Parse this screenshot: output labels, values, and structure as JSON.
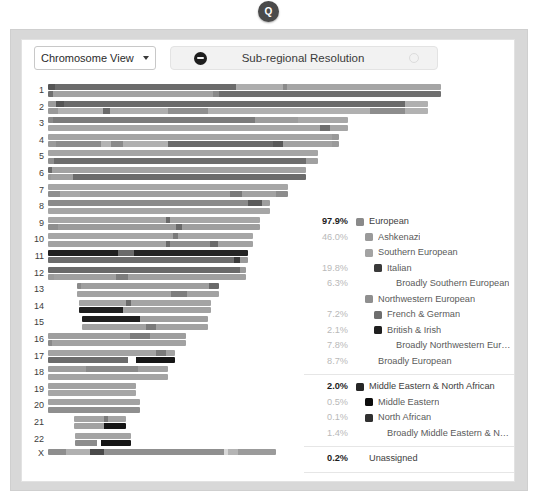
{
  "badge": {
    "label": "Q",
    "name": "quick-view-badge"
  },
  "toolbar": {
    "view_select": {
      "value": "Chromosome View",
      "icon": "chevron-down-icon"
    },
    "resolution_toggle": {
      "label": "Sub-regional Resolution",
      "left_icon": "minus-circle-icon",
      "right_icon": "circle-outline-icon"
    }
  },
  "chart_data": {
    "type": "chromosome-painting",
    "xlabel": "",
    "ylabel": "Chromosome",
    "legend_position": "right",
    "grid": false,
    "colors": {
      "european": "#8a8a8a",
      "ashkenazi": "#9a9a9a",
      "southern_european": "#a3a3a3",
      "italian": "#3a3a3a",
      "broadly_southern_european": "#b5b5b5",
      "northwestern_european": "#8f8f8f",
      "french_german": "#6e6e6e",
      "british_irish": "#1f1f1f",
      "broadly_northwestern_european": "#a8a8a8",
      "broadly_european": "#bdbdbd",
      "middle_eastern_north_african": "#262626",
      "middle_eastern": "#0d0d0d",
      "north_african": "#303030",
      "broadly_mena": "#555555",
      "unassigned": "#cfcfcf"
    },
    "chromosomes": [
      {
        "label": "1",
        "offset": 0,
        "length": 393,
        "strand_a": [
          [
            0,
            7,
            "#555555"
          ],
          [
            7,
            181,
            "#6b6b6b"
          ],
          [
            188,
            47,
            "#adadad"
          ],
          [
            235,
            4,
            "#8a8a8a"
          ],
          [
            239,
            154,
            "#a5a5a5"
          ]
        ],
        "strand_b": [
          [
            0,
            5,
            "#707070"
          ],
          [
            5,
            160,
            "#a2a2a2"
          ],
          [
            165,
            6,
            "#8a8a8a"
          ],
          [
            171,
            222,
            "#6f6f6f"
          ]
        ]
      },
      {
        "label": "2",
        "offset": 0,
        "length": 380,
        "strand_a": [
          [
            0,
            8,
            "#9c9c9c"
          ],
          [
            8,
            8,
            "#555555"
          ],
          [
            16,
            341,
            "#6a6a6a"
          ],
          [
            357,
            23,
            "#b0b0b0"
          ]
        ],
        "strand_b": [
          [
            0,
            10,
            "#9a9a9a"
          ],
          [
            10,
            45,
            "#b2b2b2"
          ],
          [
            55,
            7,
            "#6a6a6a"
          ],
          [
            62,
            58,
            "#aeaeae"
          ],
          [
            120,
            40,
            "#8f8f8f"
          ],
          [
            160,
            162,
            "#b0b0b0"
          ],
          [
            322,
            35,
            "#8d8d8d"
          ],
          [
            357,
            23,
            "#b2b2b2"
          ]
        ]
      },
      {
        "label": "3",
        "offset": 0,
        "length": 300,
        "strand_a": [
          [
            0,
            5,
            "#8a8a8a"
          ],
          [
            5,
            202,
            "#7b7b7b"
          ],
          [
            207,
            43,
            "#9d9d9d"
          ],
          [
            250,
            50,
            "#a8a8a8"
          ]
        ],
        "strand_b": [
          [
            0,
            272,
            "#a6a6a6"
          ],
          [
            272,
            10,
            "#6f6f6f"
          ],
          [
            282,
            18,
            "#a6a6a6"
          ]
        ]
      },
      {
        "label": "4",
        "offset": 0,
        "length": 291,
        "strand_a": [
          [
            0,
            284,
            "#a4a4a4"
          ],
          [
            284,
            7,
            "#9a9a9a"
          ]
        ],
        "strand_b": [
          [
            0,
            8,
            "#9a9a9a"
          ],
          [
            8,
            45,
            "#8c8c8c"
          ],
          [
            53,
            10,
            "#b4b4b4"
          ],
          [
            63,
            12,
            "#8b8b8b"
          ],
          [
            75,
            45,
            "#b0b0b0"
          ],
          [
            120,
            105,
            "#6a6a6a"
          ],
          [
            225,
            10,
            "#5a5a5a"
          ],
          [
            235,
            49,
            "#a2a2a2"
          ],
          [
            284,
            7,
            "#9a9a9a"
          ]
        ]
      },
      {
        "label": "5",
        "offset": 0,
        "length": 270,
        "strand_a": [
          [
            0,
            270,
            "#a5a5a5"
          ]
        ],
        "strand_b": [
          [
            0,
            6,
            "#8f8f8f"
          ],
          [
            6,
            252,
            "#6d6d6d"
          ],
          [
            258,
            12,
            "#a0a0a0"
          ]
        ]
      },
      {
        "label": "6",
        "offset": 0,
        "length": 258,
        "strand_a": [
          [
            0,
            4,
            "#6a6a6a"
          ],
          [
            4,
            254,
            "#a2a2a2"
          ]
        ],
        "strand_b": [
          [
            0,
            3,
            "#9a9a9a"
          ],
          [
            3,
            22,
            "#a0a0a0"
          ],
          [
            25,
            233,
            "#6b6b6b"
          ]
        ]
      },
      {
        "label": "7",
        "offset": 0,
        "length": 240,
        "strand_a": [
          [
            0,
            240,
            "#a6a6a6"
          ]
        ],
        "strand_b": [
          [
            0,
            12,
            "#8e8e8e"
          ],
          [
            12,
            20,
            "#a8a8a8"
          ],
          [
            32,
            150,
            "#9e9e9e"
          ],
          [
            182,
            12,
            "#7a7a7a"
          ],
          [
            194,
            34,
            "#a2a2a2"
          ],
          [
            228,
            12,
            "#8c8c8c"
          ]
        ]
      },
      {
        "label": "8",
        "offset": 0,
        "length": 222,
        "strand_a": [
          [
            0,
            200,
            "#8b8b8b"
          ],
          [
            200,
            14,
            "#5a5a5a"
          ],
          [
            214,
            8,
            "#9e9e9e"
          ]
        ],
        "strand_b": [
          [
            0,
            222,
            "#a6a6a6"
          ]
        ]
      },
      {
        "label": "9",
        "offset": 0,
        "length": 212,
        "strand_a": [
          [
            0,
            118,
            "#a6a6a6"
          ],
          [
            118,
            4,
            "#6a6a6a"
          ],
          [
            122,
            90,
            "#a6a6a6"
          ]
        ],
        "strand_b": [
          [
            0,
            10,
            "#8e8e8e"
          ],
          [
            10,
            118,
            "#9b9b9b"
          ],
          [
            128,
            6,
            "#6a6a6a"
          ],
          [
            134,
            78,
            "#9e9e9e"
          ]
        ]
      },
      {
        "label": "10",
        "offset": 0,
        "length": 205,
        "strand_a": [
          [
            0,
            125,
            "#a6a6a6"
          ],
          [
            125,
            5,
            "#7a7a7a"
          ],
          [
            130,
            75,
            "#a6a6a6"
          ]
        ],
        "strand_b": [
          [
            0,
            118,
            "#a2a2a2"
          ],
          [
            118,
            4,
            "#6a6a6a"
          ],
          [
            122,
            40,
            "#8f8f8f"
          ],
          [
            162,
            8,
            "#6a6a6a"
          ],
          [
            170,
            35,
            "#a2a2a2"
          ]
        ]
      },
      {
        "label": "11",
        "offset": 0,
        "length": 200,
        "strand_a": [
          [
            0,
            70,
            "#1f1f1f"
          ],
          [
            70,
            16,
            "#6a6a6a"
          ],
          [
            86,
            114,
            "#252525"
          ]
        ],
        "strand_b": [
          [
            0,
            186,
            "#6c6c6c"
          ],
          [
            186,
            6,
            "#3a3a3a"
          ],
          [
            192,
            8,
            "#9a9a9a"
          ]
        ]
      },
      {
        "label": "12",
        "offset": 0,
        "length": 198,
        "strand_a": [
          [
            0,
            192,
            "#6a6a6a"
          ],
          [
            192,
            6,
            "#9a9a9a"
          ]
        ],
        "strand_b": [
          [
            0,
            6,
            "#9a9a9a"
          ],
          [
            6,
            62,
            "#a0a0a0"
          ],
          [
            68,
            12,
            "#7d7d7d"
          ],
          [
            80,
            118,
            "#a0a0a0"
          ]
        ]
      },
      {
        "label": "13",
        "offset": 29,
        "length": 142,
        "strand_a": [
          [
            0,
            4,
            "#8a8a8a"
          ],
          [
            4,
            128,
            "#9e9e9e"
          ],
          [
            132,
            10,
            "#6a6a6a"
          ]
        ],
        "strand_b": [
          [
            0,
            94,
            "#a2a2a2"
          ],
          [
            94,
            16,
            "#7d7d7d"
          ],
          [
            110,
            32,
            "#a2a2a2"
          ]
        ]
      },
      {
        "label": "14",
        "offset": 31,
        "length": 132,
        "strand_a": [
          [
            0,
            47,
            "#a4a4a4"
          ],
          [
            47,
            5,
            "#6a6a6a"
          ],
          [
            52,
            80,
            "#a4a4a4"
          ]
        ],
        "strand_b": [
          [
            0,
            44,
            "#1f1f1f"
          ],
          [
            44,
            88,
            "#a2a2a2"
          ]
        ]
      },
      {
        "label": "15",
        "offset": 34,
        "length": 126,
        "strand_a": [
          [
            0,
            58,
            "#1f1f1f"
          ],
          [
            58,
            68,
            "#9f9f9f"
          ]
        ],
        "strand_b": [
          [
            0,
            64,
            "#a2a2a2"
          ],
          [
            64,
            10,
            "#7a7a7a"
          ],
          [
            74,
            52,
            "#a2a2a2"
          ]
        ]
      },
      {
        "label": "16",
        "offset": 0,
        "length": 138,
        "strand_a": [
          [
            0,
            82,
            "#9e9e9e"
          ],
          [
            82,
            20,
            "#7c7c7c"
          ],
          [
            102,
            36,
            "#9e9e9e"
          ]
        ],
        "strand_b": [
          [
            0,
            4,
            "#8a8a8a"
          ],
          [
            4,
            134,
            "#a2a2a2"
          ]
        ]
      },
      {
        "label": "17",
        "offset": 0,
        "length": 127,
        "strand_a": [
          [
            0,
            108,
            "#a3a3a3"
          ],
          [
            108,
            10,
            "#7a7a7a"
          ],
          [
            118,
            9,
            "#a3a3a3"
          ]
        ],
        "strand_b": [
          [
            0,
            80,
            "#6c6c6c"
          ],
          [
            80,
            8,
            "#ffffff"
          ],
          [
            88,
            39,
            "#161616"
          ]
        ]
      },
      {
        "label": "18",
        "offset": 0,
        "length": 120,
        "strand_a": [
          [
            0,
            38,
            "#9e9e9e"
          ],
          [
            38,
            52,
            "#8a8a8a"
          ],
          [
            90,
            30,
            "#a2a2a2"
          ]
        ],
        "strand_b": [
          [
            0,
            120,
            "#a4a4a4"
          ]
        ]
      },
      {
        "label": "19",
        "offset": 0,
        "length": 88,
        "strand_a": [
          [
            0,
            88,
            "#a2a2a2"
          ]
        ],
        "strand_b": [
          [
            0,
            88,
            "#a6a6a6"
          ]
        ]
      },
      {
        "label": "20",
        "offset": 0,
        "length": 92,
        "strand_a": [
          [
            0,
            92,
            "#a2a2a2"
          ]
        ],
        "strand_b": [
          [
            0,
            92,
            "#8f8f8f"
          ]
        ]
      },
      {
        "label": "21",
        "offset": 26,
        "length": 52,
        "strand_a": [
          [
            0,
            30,
            "#a4a4a4"
          ],
          [
            30,
            4,
            "#7a7a7a"
          ],
          [
            34,
            18,
            "#a4a4a4"
          ]
        ],
        "strand_b": [
          [
            0,
            30,
            "#a2a2a2"
          ],
          [
            30,
            22,
            "#161616"
          ]
        ]
      },
      {
        "label": "22",
        "offset": 27,
        "length": 56,
        "strand_a": [
          [
            0,
            56,
            "#a4a4a4"
          ]
        ],
        "strand_b": [
          [
            0,
            22,
            "#8c8c8c"
          ],
          [
            22,
            4,
            "#ffffff"
          ],
          [
            26,
            30,
            "#161616"
          ]
        ]
      },
      {
        "label": "X",
        "offset": 0,
        "length": 228,
        "single": true,
        "strand_a": [
          [
            0,
            18,
            "#8e8e8e"
          ],
          [
            18,
            24,
            "#b0b0b0"
          ],
          [
            42,
            14,
            "#4a4a4a"
          ],
          [
            56,
            120,
            "#8f8f8f"
          ],
          [
            176,
            4,
            "#d8d8d8"
          ],
          [
            180,
            10,
            "#b4b4b4"
          ],
          [
            190,
            38,
            "#9b9b9b"
          ]
        ]
      }
    ]
  },
  "legend": {
    "groups": [
      {
        "name": "european-group",
        "rows": [
          {
            "pct": "97.9%",
            "label": "European",
            "indent": 0,
            "swatch": "#8a8a8a",
            "strong": true
          },
          {
            "pct": "46.0%",
            "label": "Ashkenazi",
            "indent": 1,
            "swatch": "#9a9a9a",
            "strong": false
          },
          {
            "pct": "",
            "label": "Southern European",
            "indent": 1,
            "swatch": "#a3a3a3",
            "strong": false
          },
          {
            "pct": "19.8%",
            "label": "Italian",
            "indent": 2,
            "swatch": "#3a3a3a",
            "strong": false
          },
          {
            "pct": "6.3%",
            "label": "Broadly Southern European",
            "indent": 3,
            "swatch": null,
            "strong": false
          },
          {
            "pct": "",
            "label": "Northwestern European",
            "indent": 1,
            "swatch": "#8f8f8f",
            "strong": false
          },
          {
            "pct": "7.2%",
            "label": "French & German",
            "indent": 2,
            "swatch": "#6e6e6e",
            "strong": false
          },
          {
            "pct": "2.1%",
            "label": "British & Irish",
            "indent": 2,
            "swatch": "#1f1f1f",
            "strong": false
          },
          {
            "pct": "7.8%",
            "label": "Broadly Northwestern European",
            "indent": 3,
            "swatch": null,
            "strong": false
          },
          {
            "pct": "8.7%",
            "label": "Broadly European",
            "indent": 1,
            "swatch": null,
            "strong": false
          }
        ]
      },
      {
        "name": "mena-group",
        "rows": [
          {
            "pct": "2.0%",
            "label": "Middle Eastern & North African",
            "indent": 0,
            "swatch": "#262626",
            "strong": true
          },
          {
            "pct": "0.5%",
            "label": "Middle Eastern",
            "indent": 1,
            "swatch": "#0d0d0d",
            "strong": false
          },
          {
            "pct": "0.1%",
            "label": "North African",
            "indent": 1,
            "swatch": "#303030",
            "strong": false
          },
          {
            "pct": "1.4%",
            "label": "Broadly Middle Eastern & North Afric…",
            "indent": 2,
            "swatch": null,
            "strong": false
          }
        ]
      },
      {
        "name": "unassigned-group",
        "rows": [
          {
            "pct": "0.2%",
            "label": "Unassigned",
            "indent": 0,
            "swatch": null,
            "strong": true
          }
        ]
      },
      {
        "name": "total-group",
        "rows": [
          {
            "pct": "100%",
            "label": "",
            "indent": 0,
            "swatch": null,
            "strong": true
          }
        ]
      }
    ]
  }
}
